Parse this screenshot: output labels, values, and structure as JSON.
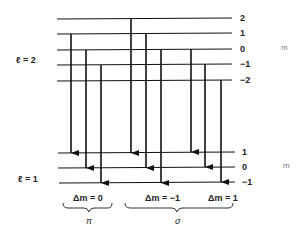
{
  "upper_level": {
    "label": "ℓ = 2",
    "m_values": [
      "2",
      "1",
      "0",
      "−1",
      "−2"
    ],
    "m_axis": "m"
  },
  "lower_level": {
    "label": "ℓ = 1",
    "m_values": [
      "1",
      "0",
      "−1"
    ],
    "m_axis": "m"
  },
  "groups": [
    {
      "delta_label": "Δm = 0",
      "polarization": "π"
    },
    {
      "delta_label": "Δm = −1",
      "polarization": "σ"
    },
    {
      "delta_label": "Δm = 1"
    }
  ]
}
